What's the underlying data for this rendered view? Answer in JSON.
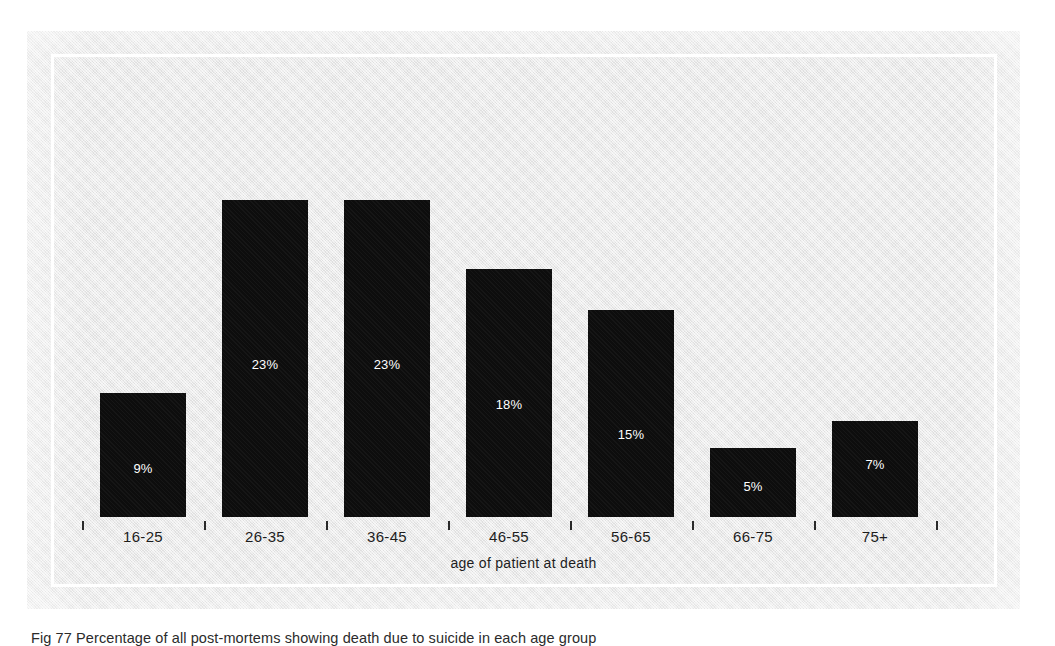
{
  "figure": {
    "caption": "Fig 77 Percentage of all post-mortems showing death due to suicide in each age group",
    "panel_color": "#e8e8e8",
    "bar_color": "#0d0d0d",
    "label_color": "#ffffff",
    "frame_color": "#ffffff"
  },
  "chart_data": {
    "type": "bar",
    "title": "",
    "xlabel": "age of patient at death",
    "ylabel": "",
    "categories": [
      "16-25",
      "26-35",
      "36-45",
      "46-55",
      "56-65",
      "66-75",
      "75+"
    ],
    "values": [
      9,
      23,
      23,
      18,
      15,
      5,
      7
    ],
    "value_labels": [
      "9%",
      "23%",
      "23%",
      "18%",
      "15%",
      "5%",
      "7%"
    ],
    "ylim": [
      0,
      26
    ],
    "grid": false,
    "legend": "none",
    "axis_ticks_between_bars": true,
    "value_label_position": "inside-bar"
  }
}
